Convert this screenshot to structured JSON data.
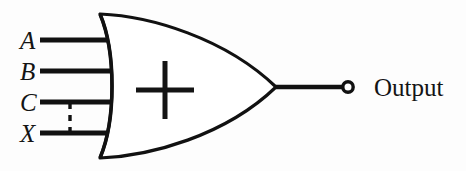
{
  "diagram": {
    "gate": {
      "type": "or-gate",
      "inner_symbol": "+",
      "inner_symbol_name": "plus-symbol",
      "fill_color": "#ffffff",
      "stroke_color": "#111111"
    },
    "background_color": "#fdfdfd",
    "ink_color": "#111111",
    "inputs": [
      {
        "label": "A",
        "name": "input-a",
        "y": 40
      },
      {
        "label": "B",
        "name": "input-b",
        "y": 71
      },
      {
        "label": "C",
        "name": "input-c",
        "y": 102
      },
      {
        "label": "X",
        "name": "input-x",
        "y": 133
      }
    ],
    "connection": {
      "name": "dashed-connection-c-x",
      "style": "dashed",
      "from": "C",
      "to": "X"
    },
    "output": {
      "label": "Output",
      "name": "output-terminal",
      "terminal_shape": "circle",
      "y": 87
    }
  }
}
